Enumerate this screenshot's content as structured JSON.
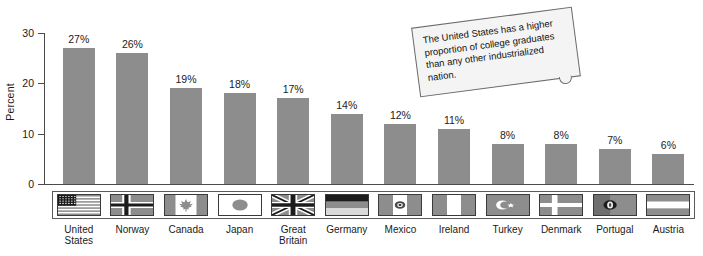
{
  "chart_data": {
    "type": "bar",
    "title": "",
    "xlabel": "",
    "ylabel": "Percent",
    "ylim": [
      0,
      30
    ],
    "yticks": [
      0,
      10,
      20,
      30
    ],
    "grid": false,
    "legend": "none",
    "value_suffix": "%",
    "categories": [
      "United States",
      "Norway",
      "Canada",
      "Japan",
      "Great Britain",
      "Germany",
      "Mexico",
      "Ireland",
      "Turkey",
      "Denmark",
      "Portugal",
      "Austria"
    ],
    "values": [
      27,
      26,
      19,
      18,
      17,
      14,
      12,
      11,
      8,
      8,
      7,
      6
    ],
    "data_labels": [
      "27%",
      "26%",
      "19%",
      "18%",
      "17%",
      "14%",
      "12%",
      "11%",
      "8%",
      "8%",
      "7%",
      "6%"
    ],
    "bar_color": "#8d8d8d",
    "axis_color": "#4a4a4a",
    "background_color": "#ffffff",
    "annotations": [
      "The United States has a higher proportion of college graduates than any other industrialized nation."
    ]
  },
  "axis": {
    "y_title": "Percent",
    "y_tick_labels": [
      "30",
      "20",
      "10",
      "0"
    ]
  },
  "bars": [
    {
      "label": "27%",
      "value": 27,
      "country": "United States",
      "flag": "flag-united-states"
    },
    {
      "label": "26%",
      "value": 26,
      "country": "Norway",
      "flag": "flag-norway"
    },
    {
      "label": "19%",
      "value": 19,
      "country": "Canada",
      "flag": "flag-canada"
    },
    {
      "label": "18%",
      "value": 18,
      "country": "Japan",
      "flag": "flag-japan"
    },
    {
      "label": "17%",
      "value": 17,
      "country": "Great Britain",
      "flag": "flag-great-britain"
    },
    {
      "label": "14%",
      "value": 14,
      "country": "Germany",
      "flag": "flag-germany"
    },
    {
      "label": "12%",
      "value": 12,
      "country": "Mexico",
      "flag": "flag-mexico"
    },
    {
      "label": "11%",
      "value": 11,
      "country": "Ireland",
      "flag": "flag-ireland"
    },
    {
      "label": "8%",
      "value": 8,
      "country": "Turkey",
      "flag": "flag-turkey"
    },
    {
      "label": "8%",
      "value": 8,
      "country": "Denmark",
      "flag": "flag-denmark"
    },
    {
      "label": "7%",
      "value": 7,
      "country": "Portugal",
      "flag": "flag-portugal"
    },
    {
      "label": "6%",
      "value": 6,
      "country": "Austria",
      "flag": "flag-austria"
    }
  ],
  "country_label_lines": [
    [
      "United",
      "States"
    ],
    [
      "Norway"
    ],
    [
      "Canada"
    ],
    [
      "Japan"
    ],
    [
      "Great",
      "Britain"
    ],
    [
      "Germany"
    ],
    [
      "Mexico"
    ],
    [
      "Ireland"
    ],
    [
      "Turkey"
    ],
    [
      "Denmark"
    ],
    [
      "Portugal"
    ],
    [
      "Austria"
    ]
  ],
  "callout": {
    "text": "The United States has a higher proportion of college graduates than any other industrialized nation."
  }
}
